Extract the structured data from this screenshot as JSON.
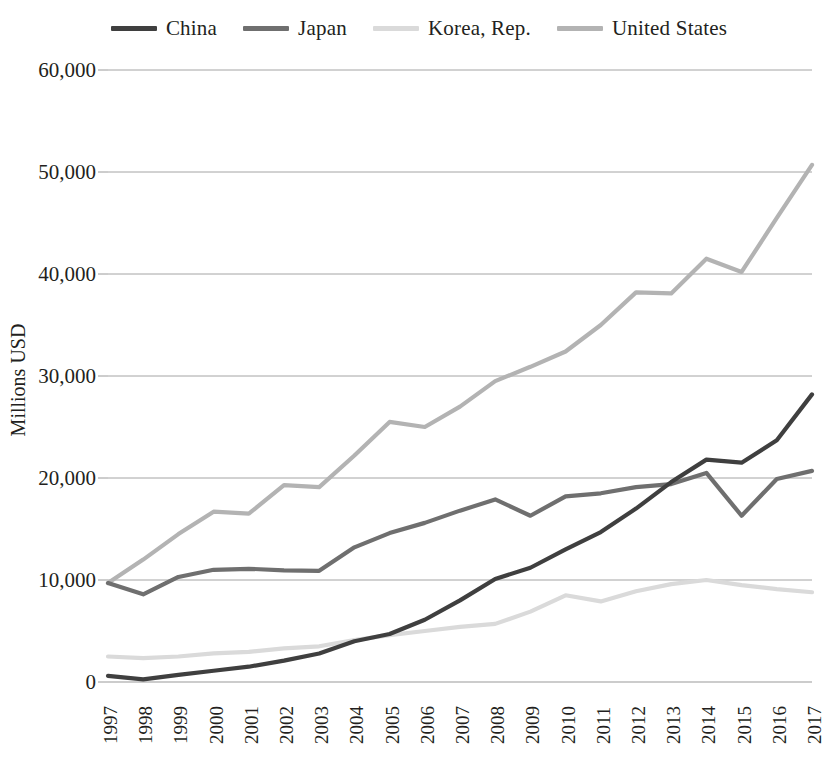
{
  "chart_data": {
    "type": "line",
    "title": "",
    "xlabel": "",
    "ylabel": "Millions USD",
    "ylim": [
      0,
      60000
    ],
    "ytick_step": 10000,
    "ytick_labels": [
      "0",
      "10,000",
      "20,000",
      "30,000",
      "40,000",
      "50,000",
      "60,000"
    ],
    "ytick_values": [
      0,
      10000,
      20000,
      30000,
      40000,
      50000,
      60000
    ],
    "grid": "horizontal",
    "legend_position": "top-center",
    "categories": [
      "1997",
      "1998",
      "1999",
      "2000",
      "2001",
      "2002",
      "2003",
      "2004",
      "2005",
      "2006",
      "2007",
      "2008",
      "2009",
      "2010",
      "2011",
      "2012",
      "2013",
      "2014",
      "2015",
      "2016",
      "2017"
    ],
    "series": [
      {
        "name": "China",
        "color": "#3f3f3f",
        "values": [
          600,
          250,
          700,
          1100,
          1500,
          2100,
          2800,
          4000,
          4700,
          6100,
          8000,
          10100,
          11200,
          13000,
          14700,
          17000,
          19600,
          21800,
          21500,
          23700,
          28200
        ]
      },
      {
        "name": "Japan",
        "color": "#6f6f6f",
        "values": [
          9700,
          8600,
          10300,
          11000,
          11100,
          10950,
          10900,
          13200,
          14600,
          15600,
          16800,
          17900,
          16300,
          18200,
          18500,
          19100,
          19400,
          20500,
          16300,
          19900,
          20700
        ]
      },
      {
        "name": "Korea, Rep.",
        "color": "#dadada",
        "values": [
          2500,
          2350,
          2500,
          2800,
          2950,
          3300,
          3500,
          4100,
          4600,
          5000,
          5400,
          5700,
          6900,
          8500,
          7900,
          8900,
          9600,
          10000,
          9500,
          9100,
          8800
        ]
      },
      {
        "name": "United States",
        "color": "#b3b3b3",
        "values": [
          9700,
          12000,
          14500,
          16700,
          16500,
          19300,
          19100,
          22200,
          25500,
          25000,
          27000,
          29500,
          30900,
          32400,
          35000,
          38200,
          38100,
          41500,
          40200,
          45500,
          50700
        ]
      }
    ]
  },
  "legend": {
    "items": [
      {
        "label": "China"
      },
      {
        "label": "Japan"
      },
      {
        "label": "Korea, Rep."
      },
      {
        "label": "United States"
      }
    ]
  }
}
